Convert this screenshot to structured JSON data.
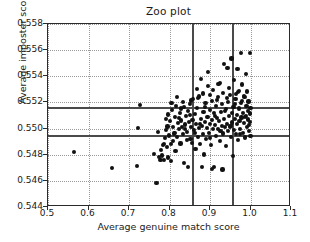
{
  "chart_data": {
    "type": "scatter",
    "title": "Zoo plot",
    "xlabel": "Average genuine match score",
    "ylabel": "Average imposter score",
    "xlim": [
      0.5,
      1.1
    ],
    "ylim": [
      0.558,
      0.544
    ],
    "y_axis_inverted": true,
    "grid": true,
    "legend": null,
    "xticks": [
      0.5,
      0.6,
      0.7,
      0.8,
      0.9,
      1.0,
      1.1
    ],
    "xticklabels": [
      "0.5",
      "0.6",
      "0.7",
      "0.8",
      "0.9",
      "1.0",
      "1.1"
    ],
    "yticks": [
      0.544,
      0.546,
      0.548,
      0.55,
      0.552,
      0.554,
      0.556,
      0.558
    ],
    "yticklabels": [
      "0.544",
      "0.546",
      "0.548",
      "0.550",
      "0.552",
      "0.554",
      "0.556",
      "0.558"
    ],
    "marker_color": "#111111",
    "marker_size": 4.2,
    "reference_lines": {
      "vertical": [
        0.856,
        0.955
      ],
      "horizontal": [
        0.54947,
        0.55163
      ],
      "color": "#4a4a4a"
    },
    "points": [
      [
        0.565,
        0.54822
      ],
      [
        0.659,
        0.547
      ],
      [
        0.719,
        0.54713
      ],
      [
        0.723,
        0.55003
      ],
      [
        0.728,
        0.55183
      ],
      [
        0.762,
        0.54807
      ],
      [
        0.768,
        0.54582
      ],
      [
        0.772,
        0.54976
      ],
      [
        0.775,
        0.54784
      ],
      [
        0.778,
        0.54762
      ],
      [
        0.779,
        0.54838
      ],
      [
        0.781,
        0.54794
      ],
      [
        0.783,
        0.54874
      ],
      [
        0.786,
        0.54758
      ],
      [
        0.788,
        0.5493
      ],
      [
        0.791,
        0.54992
      ],
      [
        0.793,
        0.54862
      ],
      [
        0.795,
        0.55016
      ],
      [
        0.796,
        0.54779
      ],
      [
        0.799,
        0.54947
      ],
      [
        0.801,
        0.55055
      ],
      [
        0.803,
        0.54885
      ],
      [
        0.804,
        0.54752
      ],
      [
        0.806,
        0.55143
      ],
      [
        0.808,
        0.55009
      ],
      [
        0.811,
        0.54963
      ],
      [
        0.813,
        0.55089
      ],
      [
        0.815,
        0.54826
      ],
      [
        0.816,
        0.55171
      ],
      [
        0.818,
        0.54935
      ],
      [
        0.821,
        0.55042
      ],
      [
        0.823,
        0.54999
      ],
      [
        0.825,
        0.55118
      ],
      [
        0.827,
        0.54886
      ],
      [
        0.829,
        0.55062
      ],
      [
        0.831,
        0.55011
      ],
      [
        0.833,
        0.54958
      ],
      [
        0.835,
        0.55167
      ],
      [
        0.836,
        0.54734
      ],
      [
        0.838,
        0.55031
      ],
      [
        0.841,
        0.55096
      ],
      [
        0.843,
        0.54974
      ],
      [
        0.845,
        0.55135
      ],
      [
        0.846,
        0.54706
      ],
      [
        0.848,
        0.55048
      ],
      [
        0.85,
        0.55187
      ],
      [
        0.852,
        0.54922
      ],
      [
        0.854,
        0.55012
      ],
      [
        0.856,
        0.54888
      ],
      [
        0.857,
        0.55065
      ],
      [
        0.859,
        0.55225
      ],
      [
        0.861,
        0.54991
      ],
      [
        0.863,
        0.55113
      ],
      [
        0.864,
        0.54846
      ],
      [
        0.866,
        0.55035
      ],
      [
        0.868,
        0.55158
      ],
      [
        0.87,
        0.54938
      ],
      [
        0.872,
        0.55003
      ],
      [
        0.873,
        0.55245
      ],
      [
        0.875,
        0.54884
      ],
      [
        0.877,
        0.55074
      ],
      [
        0.878,
        0.55382
      ],
      [
        0.88,
        0.55021
      ],
      [
        0.882,
        0.54959
      ],
      [
        0.884,
        0.55129
      ],
      [
        0.885,
        0.54801
      ],
      [
        0.887,
        0.55052
      ],
      [
        0.889,
        0.55196
      ],
      [
        0.89,
        0.54921
      ],
      [
        0.892,
        0.55007
      ],
      [
        0.894,
        0.55088
      ],
      [
        0.895,
        0.55432
      ],
      [
        0.897,
        0.54969
      ],
      [
        0.899,
        0.55143
      ],
      [
        0.9,
        0.55035
      ],
      [
        0.902,
        0.54876
      ],
      [
        0.904,
        0.55064
      ],
      [
        0.905,
        0.55211
      ],
      [
        0.907,
        0.54995
      ],
      [
        0.909,
        0.55117
      ],
      [
        0.91,
        0.54704
      ],
      [
        0.912,
        0.55027
      ],
      [
        0.914,
        0.55174
      ],
      [
        0.915,
        0.54946
      ],
      [
        0.917,
        0.55082
      ],
      [
        0.919,
        0.55239
      ],
      [
        0.92,
        0.54998
      ],
      [
        0.922,
        0.55056
      ],
      [
        0.924,
        0.55351
      ],
      [
        0.925,
        0.54903
      ],
      [
        0.927,
        0.55128
      ],
      [
        0.929,
        0.55019
      ],
      [
        0.93,
        0.55185
      ],
      [
        0.932,
        0.54962
      ],
      [
        0.934,
        0.55071
      ],
      [
        0.935,
        0.55496
      ],
      [
        0.937,
        0.55009
      ],
      [
        0.939,
        0.55147
      ],
      [
        0.94,
        0.54865
      ],
      [
        0.942,
        0.55038
      ],
      [
        0.944,
        0.55203
      ],
      [
        0.945,
        0.54981
      ],
      [
        0.947,
        0.55094
      ],
      [
        0.949,
        0.55258
      ],
      [
        0.95,
        0.55016
      ],
      [
        0.952,
        0.54934
      ],
      [
        0.954,
        0.55119
      ],
      [
        0.955,
        0.55046
      ],
      [
        0.957,
        0.54791
      ],
      [
        0.958,
        0.55168
      ],
      [
        0.96,
        0.54989
      ],
      [
        0.961,
        0.55073
      ],
      [
        0.963,
        0.55225
      ],
      [
        0.964,
        0.54956
      ],
      [
        0.966,
        0.55105
      ],
      [
        0.967,
        0.55032
      ],
      [
        0.969,
        0.55281
      ],
      [
        0.97,
        0.54912
      ],
      [
        0.972,
        0.55154
      ],
      [
        0.973,
        0.55061
      ],
      [
        0.975,
        0.54998
      ],
      [
        0.976,
        0.55196
      ],
      [
        0.978,
        0.55085
      ],
      [
        0.979,
        0.55337
      ],
      [
        0.981,
        0.54969
      ],
      [
        0.982,
        0.55122
      ],
      [
        0.984,
        0.55043
      ],
      [
        0.985,
        0.55241
      ],
      [
        0.987,
        0.54931
      ],
      [
        0.988,
        0.55098
      ],
      [
        0.99,
        0.55172
      ],
      [
        0.991,
        0.55012
      ],
      [
        0.993,
        0.55136
      ],
      [
        0.994,
        0.55069
      ],
      [
        0.995,
        0.55207
      ],
      [
        0.997,
        0.54983
      ],
      [
        0.998,
        0.55115
      ],
      [
        0.999,
        0.55051
      ],
      [
        1.0,
        0.55159
      ],
      [
        1.0,
        0.54941
      ],
      [
        0.786,
        0.54882
      ],
      [
        0.792,
        0.55072
      ],
      [
        0.809,
        0.54903
      ],
      [
        0.824,
        0.55078
      ],
      [
        0.839,
        0.54998
      ],
      [
        0.851,
        0.55104
      ],
      [
        0.862,
        0.54964
      ],
      [
        0.876,
        0.55033
      ],
      [
        0.888,
        0.55162
      ],
      [
        0.901,
        0.54928
      ],
      [
        0.913,
        0.55097
      ],
      [
        0.926,
        0.54984
      ],
      [
        0.938,
        0.55135
      ],
      [
        0.951,
        0.55021
      ],
      [
        0.962,
        0.55188
      ],
      [
        0.974,
        0.54958
      ],
      [
        0.986,
        0.55087
      ],
      [
        0.996,
        0.55028
      ],
      [
        0.867,
        0.55304
      ],
      [
        0.883,
        0.55268
      ],
      [
        0.896,
        0.55327
      ],
      [
        0.908,
        0.55294
      ],
      [
        0.921,
        0.55341
      ],
      [
        0.933,
        0.55271
      ],
      [
        0.946,
        0.55312
      ],
      [
        0.959,
        0.55369
      ],
      [
        0.971,
        0.55287
      ],
      [
        0.983,
        0.55248
      ],
      [
        0.989,
        0.55419
      ],
      [
        0.943,
        0.55463
      ],
      [
        0.968,
        0.55457
      ],
      [
        0.953,
        0.55536
      ],
      [
        0.977,
        0.55581
      ],
      [
        0.999,
        0.55578
      ],
      [
        0.905,
        0.54689
      ],
      [
        0.931,
        0.54687
      ],
      [
        0.88,
        0.54703
      ],
      [
        0.854,
        0.55215
      ],
      [
        0.87,
        0.55233
      ],
      [
        0.899,
        0.55256
      ],
      [
        0.918,
        0.55218
      ],
      [
        0.941,
        0.55234
      ],
      [
        0.965,
        0.55263
      ],
      [
        0.98,
        0.55213
      ],
      [
        0.992,
        0.55284
      ],
      [
        0.813,
        0.54967
      ],
      [
        0.828,
        0.55153
      ],
      [
        0.844,
        0.54911
      ],
      [
        0.797,
        0.55108
      ],
      [
        0.805,
        0.55195
      ],
      [
        0.819,
        0.55241
      ],
      [
        0.834,
        0.55206
      ]
    ]
  }
}
